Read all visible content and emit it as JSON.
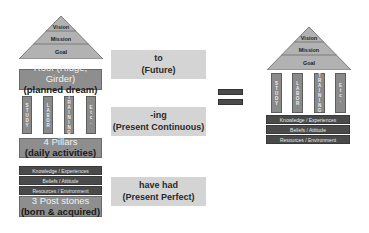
{
  "left_house": {
    "pyramid": [
      "Vision",
      "Mission",
      "Goal"
    ],
    "roof": {
      "line1": "Roof (Ridge, Girder)",
      "line2": "(planned dream)"
    },
    "pillars": [
      "STUDY",
      "LABOR",
      "TRAINING",
      "Etc."
    ],
    "pillars_box": {
      "line1": "4 Pillars",
      "line2": "(daily activities)"
    },
    "foundation_bars": [
      "Knowledge / Experiences",
      "Beliefs / Attitude",
      "Resources / Environment"
    ],
    "stones_box": {
      "line1": "3 Post stones",
      "line2": "(born & acquired)"
    }
  },
  "middle": {
    "future": {
      "line1": "to",
      "line2": "(Future)"
    },
    "continuous": {
      "line1": "-ing",
      "line2": "(Present Continuous)"
    },
    "perfect": {
      "line1": "have had",
      "line2": "(Present Perfect)"
    }
  },
  "equals_sign": "=",
  "right_house": {
    "pyramid": [
      "Vision",
      "Mission",
      "Goal"
    ],
    "pillars": [
      "STUDY",
      "LABOR",
      "TRAINING",
      "Etc."
    ],
    "foundation_bars": [
      "Knowledge / Experiences",
      "Beliefs / Attitude",
      "Resources / Environment"
    ]
  },
  "colors": {
    "pyramid": "#b0b0b0",
    "roof": "#8e8e8e",
    "pillar": "#8a8a8a",
    "bar": "#4a4a4a",
    "mid_box": "#d4d4d4",
    "equals": "#4b4b4b"
  }
}
